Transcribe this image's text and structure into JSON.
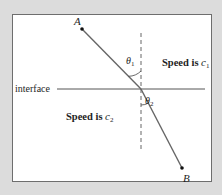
{
  "diagram": {
    "type": "refraction",
    "points": {
      "A": {
        "label": "A"
      },
      "B": {
        "label": "B"
      }
    },
    "interface_label": "interface",
    "regions": {
      "upper": {
        "prefix": "Speed is ",
        "symbol": "c",
        "subscript": "1"
      },
      "lower": {
        "prefix": "Speed is ",
        "symbol": "c",
        "subscript": "2"
      }
    },
    "angles": {
      "theta1": {
        "symbol": "θ",
        "subscript": "1"
      },
      "theta2": {
        "symbol": "θ",
        "subscript": "2"
      }
    },
    "colors": {
      "background": "#dcdcdc",
      "frame_fill": "#ffffff",
      "frame_border": "#6e6e6e",
      "line": "#555555",
      "text": "#1e1e1e"
    }
  }
}
